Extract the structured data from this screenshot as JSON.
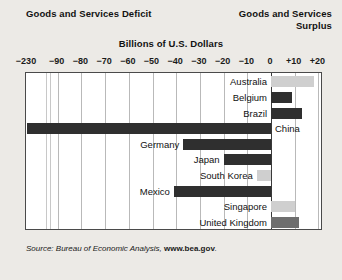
{
  "titles": {
    "deficit": "Goods and Services Deficit",
    "surplus": "Goods and Services\nSurplus",
    "surplus_line1": "Goods and Services",
    "surplus_line2": "Surplus",
    "units": "Billions of U.S. Dollars"
  },
  "source": {
    "prefix": "Source: Bureau of Economic Analysis, ",
    "site": "www.bea.gov",
    "suffix": "."
  },
  "chart_data": {
    "type": "bar",
    "orientation": "horizontal",
    "title": "Billions of U.S. Dollars",
    "subtitle_left": "Goods and Services Deficit",
    "subtitle_right": "Goods and Services Surplus",
    "xlabel": "Billions of U.S. Dollars",
    "ylabel": "",
    "grid": true,
    "legend": "none",
    "axis_break": true,
    "axis_break_between": [
      -230,
      -90
    ],
    "xlim": [
      -230,
      20
    ],
    "tick_labels": [
      "−230",
      "−90",
      "−80",
      "−70",
      "−60",
      "−50",
      "−40",
      "−30",
      "−20",
      "−10",
      "0",
      "+10",
      "+20"
    ],
    "tick_values": [
      -230,
      -90,
      -80,
      -70,
      -60,
      -50,
      -40,
      -30,
      -20,
      -10,
      0,
      10,
      20
    ],
    "categories": [
      "Australia",
      "Belgium",
      "Brazil",
      "China",
      "Germany",
      "Japan",
      "South Korea",
      "Mexico",
      "Singapore",
      "United Kingdom"
    ],
    "values": [
      18,
      9,
      13,
      -232,
      -37,
      -20,
      -6,
      -41,
      10,
      12
    ],
    "bars": [
      {
        "label": "Australia",
        "value": 18,
        "shade": "light",
        "label_side": "right"
      },
      {
        "label": "Belgium",
        "value": 9,
        "shade": "dark",
        "label_side": "right"
      },
      {
        "label": "Brazil",
        "value": 13,
        "shade": "dark",
        "label_side": "right"
      },
      {
        "label": "China",
        "value": -232,
        "shade": "dark",
        "label_side": "left"
      },
      {
        "label": "Germany",
        "value": -37,
        "shade": "dark",
        "label_side": "right"
      },
      {
        "label": "Japan",
        "value": -20,
        "shade": "dark",
        "label_side": "right"
      },
      {
        "label": "South Korea",
        "value": -6,
        "shade": "light",
        "label_side": "right"
      },
      {
        "label": "Mexico",
        "value": -41,
        "shade": "dark",
        "label_side": "right"
      },
      {
        "label": "Singapore",
        "value": 10,
        "shade": "light",
        "label_side": "right"
      },
      {
        "label": "United Kingdom",
        "value": 12,
        "shade": "mid",
        "label_side": "right"
      }
    ],
    "colors": {
      "dark": "#2f2f2f",
      "mid": "#6e6e6e",
      "light": "#cfcfcf",
      "plot_background": "#ffffff",
      "page_background": "#eceae6",
      "gridline": "#b9b9b9",
      "axis": "#3a3a3a"
    }
  }
}
